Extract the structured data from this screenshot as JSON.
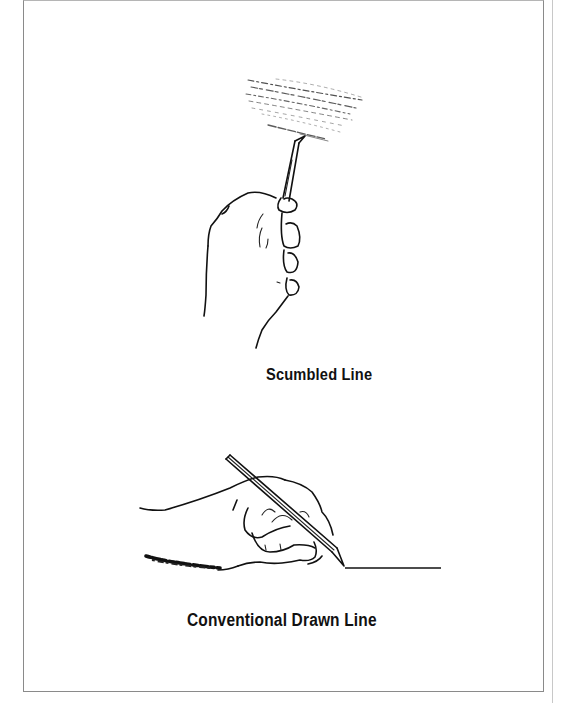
{
  "illustrations": [
    {
      "id": "scumbled",
      "caption": "Scumbled Line",
      "depicts": "hand holding pencil upright making scumbled (scribbled) strokes"
    },
    {
      "id": "conventional",
      "caption": "Conventional Drawn Line",
      "depicts": "hand holding pencil at an angle drawing a straight horizontal line"
    }
  ]
}
